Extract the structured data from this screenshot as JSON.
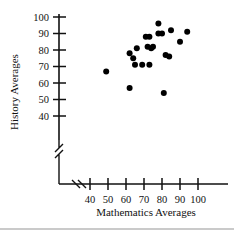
{
  "chart_data": {
    "type": "scatter",
    "title": "",
    "xlabel": "Mathematics Averages",
    "ylabel": "History Averages",
    "xlim": [
      35,
      104
    ],
    "ylim": [
      36,
      104
    ],
    "xticks": [
      40,
      50,
      60,
      70,
      80,
      90,
      100
    ],
    "yticks": [
      40,
      50,
      60,
      70,
      80,
      90,
      100
    ],
    "xtick_labels": [
      "40",
      "50",
      "60",
      "70",
      "80",
      "90",
      "100"
    ],
    "ytick_labels": [
      "40",
      "50",
      "60",
      "70",
      "80",
      "90",
      "100"
    ],
    "grid": false,
    "legend": false,
    "x_axis_break": true,
    "y_axis_break": true,
    "marker": "filled-circle",
    "marker_color": "#000000",
    "points": [
      {
        "x": 49,
        "y": 67
      },
      {
        "x": 62,
        "y": 57
      },
      {
        "x": 62,
        "y": 78
      },
      {
        "x": 64,
        "y": 75
      },
      {
        "x": 65,
        "y": 71
      },
      {
        "x": 66,
        "y": 81
      },
      {
        "x": 69,
        "y": 71
      },
      {
        "x": 71,
        "y": 88
      },
      {
        "x": 73,
        "y": 88
      },
      {
        "x": 72,
        "y": 82
      },
      {
        "x": 74,
        "y": 81
      },
      {
        "x": 75,
        "y": 82
      },
      {
        "x": 73,
        "y": 71
      },
      {
        "x": 78,
        "y": 96
      },
      {
        "x": 78,
        "y": 90
      },
      {
        "x": 80,
        "y": 90
      },
      {
        "x": 81,
        "y": 54
      },
      {
        "x": 82,
        "y": 77
      },
      {
        "x": 84,
        "y": 76
      },
      {
        "x": 85,
        "y": 92
      },
      {
        "x": 90,
        "y": 85
      },
      {
        "x": 94,
        "y": 91
      }
    ]
  }
}
